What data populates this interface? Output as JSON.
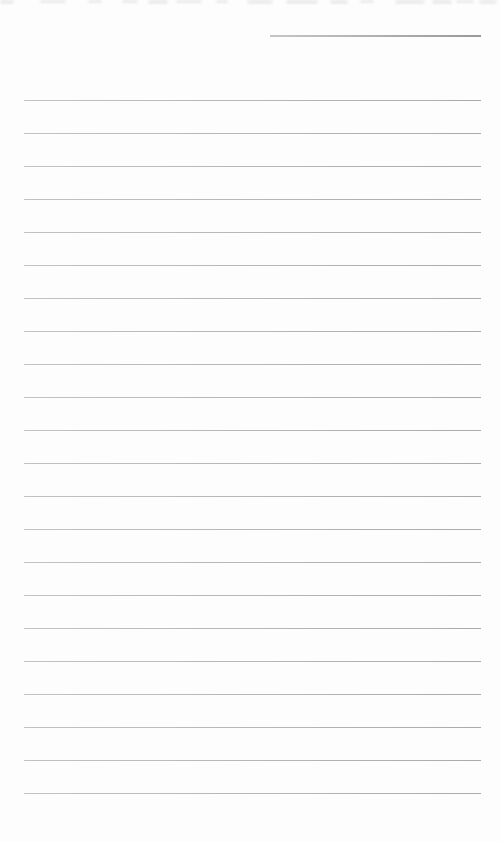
{
  "page": {
    "background_color": "#fdfdfd"
  },
  "header_line": {
    "x": 270,
    "y": 35,
    "width": 211,
    "color_left": "#c6c6c6",
    "color_right": "#999999"
  },
  "ruled_lines": {
    "count": 22,
    "first_y": 100,
    "spacing": 33,
    "left": 24,
    "width": 457,
    "thickness": 1,
    "color_left": "#c2c2c2",
    "color_right": "#ababab"
  },
  "top_edge_remnants": {
    "color": "#ececec",
    "marks": [
      {
        "x": 0,
        "w": 14,
        "h": 4
      },
      {
        "x": 40,
        "w": 26,
        "h": 3
      },
      {
        "x": 88,
        "w": 14,
        "h": 3
      },
      {
        "x": 122,
        "w": 16,
        "h": 3
      },
      {
        "x": 148,
        "w": 20,
        "h": 4
      },
      {
        "x": 176,
        "w": 26,
        "h": 3
      },
      {
        "x": 216,
        "w": 12,
        "h": 3
      },
      {
        "x": 247,
        "w": 26,
        "h": 4
      },
      {
        "x": 286,
        "w": 32,
        "h": 4
      },
      {
        "x": 330,
        "w": 18,
        "h": 4
      },
      {
        "x": 360,
        "w": 14,
        "h": 3
      },
      {
        "x": 395,
        "w": 30,
        "h": 4
      },
      {
        "x": 432,
        "w": 20,
        "h": 4
      },
      {
        "x": 456,
        "w": 18,
        "h": 3
      },
      {
        "x": 479,
        "w": 18,
        "h": 4
      }
    ]
  }
}
